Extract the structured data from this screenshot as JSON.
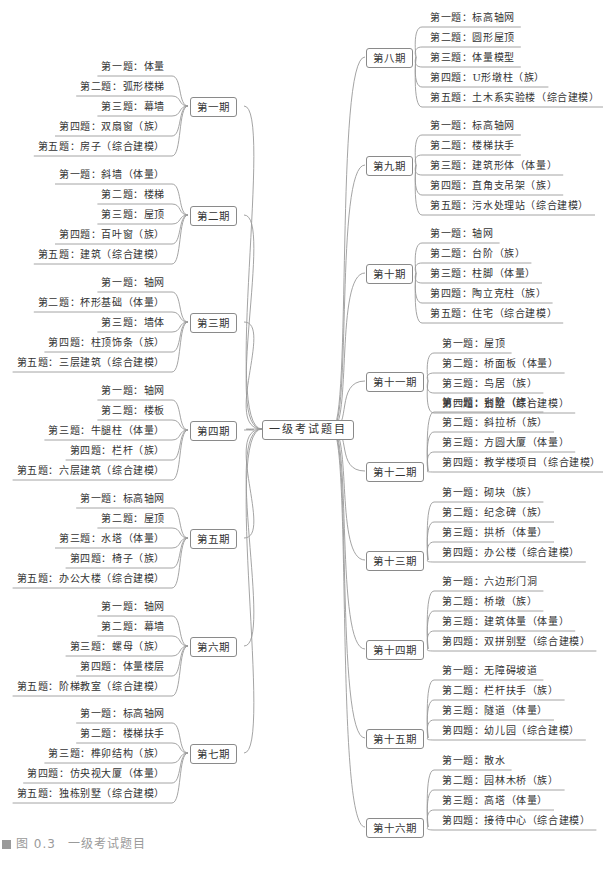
{
  "root": {
    "label": "一级考试题目"
  },
  "caption": {
    "figure": "图 0.3",
    "title": "一级考试题目"
  },
  "colors": {
    "line": "#9a9a9a",
    "text": "#333333",
    "caption": "#9a9a9a"
  },
  "left": [
    {
      "label": "第一期",
      "items": [
        "第一题：体量",
        "第二题：弧形楼梯",
        "第三题：幕墙",
        "第四题：双扇窗（族）",
        "第五题：房子（综合建模）"
      ]
    },
    {
      "label": "第二期",
      "items": [
        "第一题：斜墙（体量）",
        "第二题：楼梯",
        "第三题：屋顶",
        "第四题：百叶窗（族）",
        "第五题：建筑（综合建模）"
      ]
    },
    {
      "label": "第三期",
      "items": [
        "第一题：轴网",
        "第二题：杯形基础（体量）",
        "第三题：墙体",
        "第四题：柱顶饰条（族）",
        "第五题：三层建筑（综合建模）"
      ]
    },
    {
      "label": "第四期",
      "items": [
        "第一题：轴网",
        "第二题：楼板",
        "第三题：牛腿柱（体量）",
        "第四题：栏杆（族）",
        "第五题：六层建筑（综合建模）"
      ]
    },
    {
      "label": "第五期",
      "items": [
        "第一题：标高轴网",
        "第二题：屋顶",
        "第三题：水塔（体量）",
        "第四题：椅子（族）",
        "第五题：办公大楼（综合建模）"
      ]
    },
    {
      "label": "第六期",
      "items": [
        "第一题：轴网",
        "第二题：幕墙",
        "第三题：螺母（族）",
        "第四题：体量楼层",
        "第五题：阶梯教室（综合建模）"
      ]
    },
    {
      "label": "第七期",
      "items": [
        "第一题：标高轴网",
        "第二题：楼梯扶手",
        "第三题：榫卯结构（族）",
        "第四题：仿央视大厦（体量）",
        "第五题：独栋别墅（综合建模）"
      ]
    }
  ],
  "right": [
    {
      "label": "第八期",
      "items": [
        "第一题：标高轴网",
        "第二题：圆形屋顶",
        "第三题：体量模型",
        "第四题：U形墩柱（族）",
        "第五题：土木系实验楼（综合建模）"
      ]
    },
    {
      "label": "第九期",
      "items": [
        "第一题：标高轴网",
        "第二题：楼梯扶手",
        "第三题：建筑形体（体量）",
        "第四题：直角支吊架（族）",
        "第五题：污水处理站（综合建模）"
      ]
    },
    {
      "label": "第十期",
      "items": [
        "第一题：轴网",
        "第二题：台阶（族）",
        "第三题：柱脚（体量）",
        "第四题：陶立克柱（族）",
        "第五题：住宅（综合建模）"
      ]
    },
    {
      "label": "第十一期",
      "items": [
        "第一题：屋顶",
        "第二题：桥面板（体量）",
        "第三题：鸟居（族）",
        "第四题：别墅（综合建模）"
      ]
    },
    {
      "label": "第十二期",
      "items": [
        "第一题：台阶（族）",
        "第二题：斜拉桥（族）",
        "第三题：方圆大厦（体量）",
        "第四题：教学楼项目（综合建模）"
      ]
    },
    {
      "label": "第十三期",
      "items": [
        "第一题：砌块（族）",
        "第二题：纪念碑（族）",
        "第三题：拱桥（体量）",
        "第四题：办公楼（综合建模）"
      ]
    },
    {
      "label": "第十四期",
      "items": [
        "第一题：六边形门洞",
        "第二题：桥墩（族）",
        "第三题：建筑体量（体量）",
        "第四题：双拼别墅（综合建模）"
      ]
    },
    {
      "label": "第十五期",
      "items": [
        "第一题：无障碍坡道",
        "第二题：栏杆扶手（族）",
        "第三题：隧道（体量）",
        "第四题：幼儿园（综合建模）"
      ]
    },
    {
      "label": "第十六期",
      "items": [
        "第一题：散水",
        "第二题：园林木桥（族）",
        "第三题：高塔（体量）",
        "第四题：接待中心（综合建模）"
      ]
    }
  ]
}
